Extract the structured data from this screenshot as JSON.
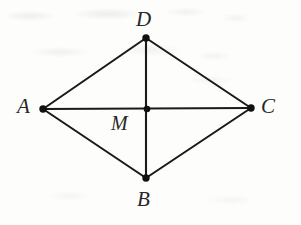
{
  "figure": {
    "kind": "geometry-diagram",
    "shape_name": "rhombus",
    "canvas": {
      "width": 301,
      "height": 225
    },
    "style": {
      "background_color": "#fdfdfc",
      "line_color": "#1a1a1a",
      "label_color": "#272727",
      "line_width": 2,
      "vertex_dot_radius": 3.6
    },
    "points": [
      {
        "id": "A",
        "label": "A",
        "x": 43,
        "y": 109,
        "label_x": 17,
        "label_y": 96,
        "dot": true
      },
      {
        "id": "D",
        "label": "D",
        "x": 146,
        "y": 38,
        "label_x": 136,
        "label_y": 9,
        "dot": true
      },
      {
        "id": "C",
        "label": "C",
        "x": 251,
        "y": 108,
        "label_x": 261,
        "label_y": 96,
        "dot": true
      },
      {
        "id": "B",
        "label": "B",
        "x": 146,
        "y": 178,
        "label_x": 137,
        "label_y": 189,
        "dot": true
      },
      {
        "id": "M",
        "label": "M",
        "x": 147,
        "y": 109,
        "label_x": 111,
        "label_y": 113,
        "dot": true
      }
    ],
    "edges": [
      {
        "id": "AD",
        "from": "A",
        "to": "D",
        "role": "side"
      },
      {
        "id": "DC",
        "from": "D",
        "to": "C",
        "role": "side"
      },
      {
        "id": "CB",
        "from": "C",
        "to": "B",
        "role": "side"
      },
      {
        "id": "BA",
        "from": "B",
        "to": "A",
        "role": "side"
      },
      {
        "id": "AC",
        "from": "A",
        "to": "C",
        "role": "diagonal"
      },
      {
        "id": "DB",
        "from": "D",
        "to": "B",
        "role": "diagonal"
      }
    ]
  }
}
